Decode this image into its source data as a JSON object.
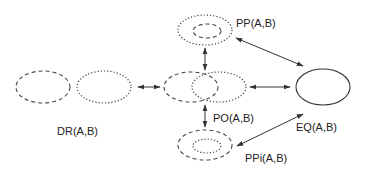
{
  "diagram": {
    "type": "region-connection-calculus-relations",
    "colors": {
      "stroke": "#444444",
      "text": "#222222",
      "background": "#ffffff"
    },
    "nodes": [
      {
        "id": "DR",
        "label": "DR(A,B)",
        "description": "disconnected: two separate ellipses (dashed A, dotted B)"
      },
      {
        "id": "PO",
        "label": "PO(A,B)",
        "description": "partial overlap: dashed A overlaps dotted B"
      },
      {
        "id": "PP",
        "label": "PP(A,B)",
        "description": "proper part: dashed A inside dotted B"
      },
      {
        "id": "PPi",
        "label": "PPi(A,B)",
        "description": "proper part inverse: dotted B inside dashed A"
      },
      {
        "id": "EQ",
        "label": "EQ(A,B)",
        "description": "equal: single solid ellipse"
      }
    ],
    "edges": [
      {
        "from": "DR",
        "to": "PO",
        "bidirectional": true
      },
      {
        "from": "PO",
        "to": "PP",
        "bidirectional": true
      },
      {
        "from": "PO",
        "to": "PPi",
        "bidirectional": true
      },
      {
        "from": "PO",
        "to": "EQ",
        "bidirectional": true
      },
      {
        "from": "PP",
        "to": "EQ",
        "bidirectional": true
      },
      {
        "from": "PPi",
        "to": "EQ",
        "bidirectional": true
      }
    ]
  },
  "labels": {
    "dr": "DR(A,B)",
    "po": "PO(A,B)",
    "pp": "PP(A,B)",
    "ppi": "PPi(A,B)",
    "eq": "EQ(A,B)"
  }
}
